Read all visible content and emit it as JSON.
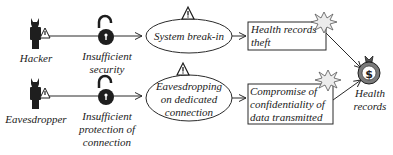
{
  "diagram": {
    "colors": {
      "line": "#2a2a2a",
      "icon_dark": "#1e1e1e",
      "money_bag": "#7a7a7a",
      "burst": "#e8e8e8"
    },
    "actors": [
      {
        "label": "Hacker",
        "icon": "hacker-icon"
      },
      {
        "label": "Eavesdropper",
        "icon": "eavesdropper-icon"
      }
    ],
    "vulnerabilities": [
      {
        "lines": [
          "Insufficient",
          "security"
        ],
        "icon": "open-padlock-icon"
      },
      {
        "lines": [
          "Insufficient",
          "protection of",
          "connection"
        ],
        "icon": "open-padlock-icon"
      }
    ],
    "threats": [
      {
        "lines": [
          "System break-in"
        ],
        "icon": "warning-triangle-icon"
      },
      {
        "lines": [
          "Eavesdropping",
          "on dedicated",
          "connection"
        ],
        "icon": "warning-triangle-icon"
      }
    ],
    "impacts": [
      {
        "lines": [
          "Health records",
          "theft"
        ],
        "icon": "explosion-burst-icon"
      },
      {
        "lines": [
          "Compromise of",
          "confidentiality of",
          "data transmitted"
        ],
        "icon": "explosion-burst-icon"
      }
    ],
    "asset": {
      "lines": [
        "Health",
        "records"
      ],
      "icon": "money-bag-icon",
      "symbol": "$"
    }
  }
}
